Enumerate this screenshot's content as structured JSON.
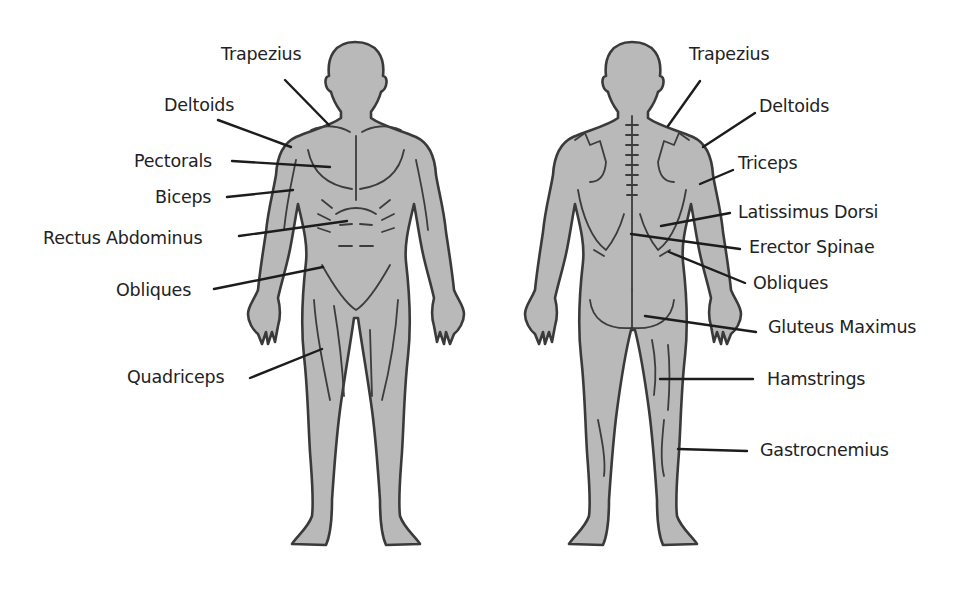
{
  "diagram": {
    "figures": [
      {
        "id": "front",
        "name": "Anterior view (front)"
      },
      {
        "id": "back",
        "name": "Posterior view (back)"
      }
    ],
    "colors": {
      "body_fill": "#b9b9b9",
      "outline": "#3a3a3a",
      "leader_line": "#1c1c1c",
      "label_text": "#222222",
      "background": "#ffffff"
    },
    "front_labels": [
      {
        "text": "Trapezius",
        "x": 221,
        "y": 44,
        "align": "left",
        "line": [
          285,
          80,
          329,
          125
        ]
      },
      {
        "text": "Deltoids",
        "x": 164,
        "y": 95,
        "align": "left",
        "line": [
          218,
          120,
          291,
          147
        ]
      },
      {
        "text": "Pectorals",
        "x": 134,
        "y": 151,
        "align": "left",
        "line": [
          232,
          161,
          330,
          167
        ]
      },
      {
        "text": "Biceps",
        "x": 155,
        "y": 187,
        "align": "left",
        "line": [
          227,
          197,
          293,
          190
        ]
      },
      {
        "text": "Rectus Abdominus",
        "x": 43,
        "y": 228,
        "align": "left",
        "line": [
          239,
          236,
          347,
          221
        ]
      },
      {
        "text": "Obliques",
        "x": 116,
        "y": 280,
        "align": "left",
        "line": [
          214,
          289,
          323,
          267
        ]
      },
      {
        "text": "Quadriceps",
        "x": 127,
        "y": 367,
        "align": "left",
        "line": [
          250,
          378,
          322,
          349
        ]
      }
    ],
    "back_labels": [
      {
        "text": "Trapezius",
        "x": 689,
        "y": 44,
        "align": "left",
        "line": [
          700,
          81,
          668,
          126
        ]
      },
      {
        "text": "Deltoids",
        "x": 759,
        "y": 96,
        "align": "left",
        "line": [
          755,
          113,
          703,
          147
        ]
      },
      {
        "text": "Triceps",
        "x": 738,
        "y": 153,
        "align": "left",
        "line": [
          733,
          170,
          700,
          184
        ]
      },
      {
        "text": "Latissimus Dorsi",
        "x": 738,
        "y": 202,
        "align": "left",
        "line": [
          730,
          213,
          661,
          226
        ]
      },
      {
        "text": "Erector Spinae",
        "x": 749,
        "y": 237,
        "align": "left",
        "line": [
          740,
          249,
          631,
          234
        ]
      },
      {
        "text": "Obliques",
        "x": 753,
        "y": 273,
        "align": "left",
        "line": [
          745,
          283,
          669,
          252
        ]
      },
      {
        "text": "Gluteus Maximus",
        "x": 768,
        "y": 317,
        "align": "left",
        "line": [
          756,
          332,
          645,
          316
        ]
      },
      {
        "text": "Hamstrings",
        "x": 767,
        "y": 369,
        "align": "left",
        "line": [
          753,
          379,
          660,
          379
        ]
      },
      {
        "text": "Gastrocnemius",
        "x": 760,
        "y": 440,
        "align": "left",
        "line": [
          747,
          451,
          678,
          449
        ]
      }
    ]
  }
}
